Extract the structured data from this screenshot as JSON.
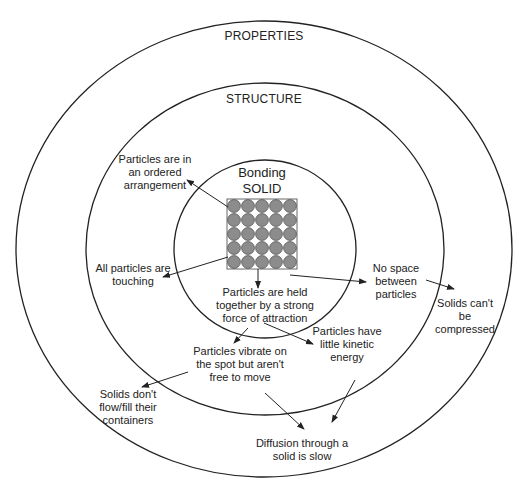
{
  "rings": {
    "outer": {
      "title": "PROPERTIES"
    },
    "middle": {
      "title": "STRUCTURE"
    },
    "inner": {
      "title": "Bonding\nSOLID"
    }
  },
  "particle_grid": {
    "rows": 5,
    "cols": 5,
    "fill": "#8c8c8c",
    "stroke": "#555555"
  },
  "structure_labels": {
    "ordered": "Particles are in\nan ordered\narrangement",
    "touching": "All particles are\ntouching",
    "held_together": "Particles are held\ntogether by a strong\nforce of attraction",
    "no_space": "No space\nbetween\nparticles",
    "kinetic": "Particles have\nlittle kinetic\nenergy",
    "vibrate": "Particles vibrate on\nthe spot but aren't\nfree to move"
  },
  "property_labels": {
    "compressed": "Solids can't\nbe\ncompressed",
    "flow": "Solids don't\nflow/fill their\ncontainers",
    "diffusion": "Diffusion through a\nsolid is slow"
  },
  "colors": {
    "line": "#222222",
    "background": "#ffffff"
  }
}
